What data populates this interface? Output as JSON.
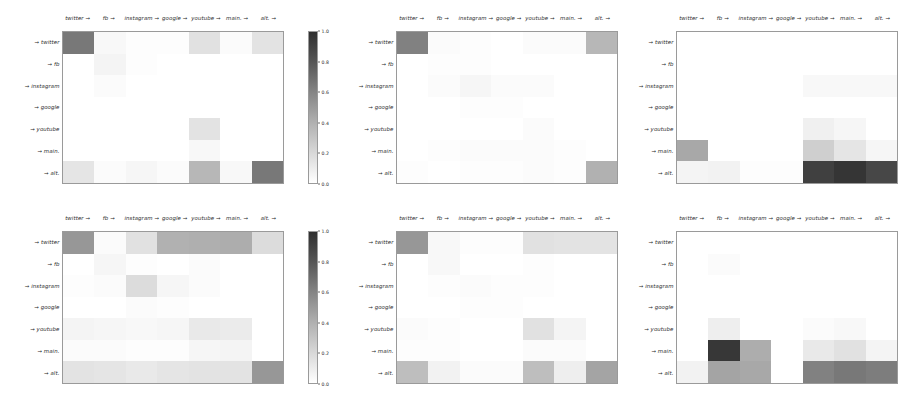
{
  "figure": {
    "width": 911,
    "height": 400,
    "background": "#ffffff",
    "cmap_low": "#ffffff",
    "cmap_high": "#2f2f2f",
    "axis_color": "#9a9a9a"
  },
  "labels": {
    "columns": [
      "twitter →",
      "fb →",
      "instagram →",
      "google →",
      "youtube →",
      "main. →",
      "alt. →"
    ],
    "rows": [
      "→ twitter",
      "→ fb",
      "→ instagram",
      "→ google",
      "→ youtube",
      "→ main.",
      "→ alt."
    ]
  },
  "colorbars": [
    {
      "id": "colorbar-row-1",
      "ticks": [
        "1.0",
        "0.8",
        "0.6",
        "0.4",
        "0.2",
        "0.0"
      ],
      "vmin": 0.0,
      "vmax": 1.0
    },
    {
      "id": "colorbar-row-2",
      "ticks": [
        "1.0",
        "0.8",
        "0.6",
        "0.4",
        "0.2",
        "0.0"
      ],
      "vmin": 0.0,
      "vmax": 1.0
    }
  ],
  "chart_data": {
    "type": "heatmap",
    "title": "",
    "xlabel": "",
    "ylabel": "",
    "grid": false,
    "legend": "colorbar right of first panel in each row",
    "colormap": "Greys",
    "vmin": 0.0,
    "vmax": 1.0,
    "x_tick_labels": [
      "twitter →",
      "fb →",
      "instagram →",
      "google →",
      "youtube →",
      "main. →",
      "alt. →"
    ],
    "y_tick_labels": [
      "→ twitter",
      "→ fb",
      "→ instagram",
      "→ google",
      "→ youtube",
      "→ main.",
      "→ alt."
    ],
    "panels": [
      {
        "id": "panel-top-left",
        "row": 0,
        "col": 0,
        "matrix": [
          [
            0.62,
            0.03,
            0.01,
            0.01,
            0.14,
            0.02,
            0.13
          ],
          [
            0.0,
            0.05,
            0.01,
            0.0,
            0.0,
            0.0,
            0.0
          ],
          [
            0.0,
            0.02,
            0.0,
            0.0,
            0.0,
            0.0,
            0.0
          ],
          [
            0.0,
            0.0,
            0.0,
            0.0,
            0.0,
            0.0,
            0.0
          ],
          [
            0.0,
            0.0,
            0.0,
            0.0,
            0.13,
            0.0,
            0.0
          ],
          [
            0.0,
            0.0,
            0.0,
            0.0,
            0.03,
            0.0,
            0.0
          ],
          [
            0.12,
            0.02,
            0.04,
            0.02,
            0.33,
            0.03,
            0.62
          ]
        ]
      },
      {
        "id": "panel-top-middle",
        "row": 0,
        "col": 1,
        "matrix": [
          [
            0.58,
            0.02,
            0.01,
            0.0,
            0.02,
            0.02,
            0.33
          ],
          [
            0.0,
            0.01,
            0.01,
            0.0,
            0.0,
            0.0,
            0.0
          ],
          [
            0.0,
            0.02,
            0.04,
            0.02,
            0.02,
            0.0,
            0.0
          ],
          [
            0.0,
            0.0,
            0.01,
            0.01,
            0.0,
            0.0,
            0.0
          ],
          [
            0.0,
            0.0,
            0.0,
            0.0,
            0.02,
            0.0,
            0.0
          ],
          [
            0.0,
            0.01,
            0.02,
            0.02,
            0.02,
            0.01,
            0.0
          ],
          [
            0.01,
            0.0,
            0.01,
            0.01,
            0.02,
            0.01,
            0.36
          ]
        ]
      },
      {
        "id": "panel-top-right",
        "row": 0,
        "col": 2,
        "matrix": [
          [
            0.0,
            0.0,
            0.0,
            0.0,
            0.0,
            0.0,
            0.0
          ],
          [
            0.0,
            0.0,
            0.0,
            0.0,
            0.0,
            0.0,
            0.0
          ],
          [
            0.0,
            0.0,
            0.0,
            0.0,
            0.03,
            0.03,
            0.03
          ],
          [
            0.0,
            0.0,
            0.0,
            0.0,
            0.0,
            0.0,
            0.0
          ],
          [
            0.0,
            0.0,
            0.0,
            0.0,
            0.07,
            0.04,
            0.0
          ],
          [
            0.4,
            0.0,
            0.0,
            0.0,
            0.22,
            0.12,
            0.04
          ],
          [
            0.05,
            0.06,
            0.01,
            0.01,
            0.88,
            0.93,
            0.85
          ]
        ]
      },
      {
        "id": "panel-bottom-left",
        "row": 1,
        "col": 0,
        "matrix": [
          [
            0.48,
            0.02,
            0.14,
            0.36,
            0.37,
            0.38,
            0.16
          ],
          [
            0.0,
            0.04,
            0.01,
            0.0,
            0.02,
            0.0,
            0.0
          ],
          [
            0.01,
            0.02,
            0.16,
            0.04,
            0.02,
            0.0,
            0.0
          ],
          [
            0.0,
            0.0,
            0.02,
            0.01,
            0.0,
            0.0,
            0.0
          ],
          [
            0.05,
            0.04,
            0.03,
            0.04,
            0.1,
            0.09,
            0.0
          ],
          [
            0.02,
            0.02,
            0.01,
            0.01,
            0.04,
            0.05,
            0.0
          ],
          [
            0.13,
            0.12,
            0.1,
            0.12,
            0.13,
            0.13,
            0.48
          ]
        ]
      },
      {
        "id": "panel-bottom-middle",
        "row": 1,
        "col": 1,
        "matrix": [
          [
            0.48,
            0.03,
            0.01,
            0.01,
            0.14,
            0.13,
            0.13
          ],
          [
            0.0,
            0.03,
            0.0,
            0.0,
            0.01,
            0.0,
            0.0
          ],
          [
            0.0,
            0.01,
            0.02,
            0.01,
            0.01,
            0.0,
            0.0
          ],
          [
            0.0,
            0.0,
            0.01,
            0.01,
            0.0,
            0.0,
            0.0
          ],
          [
            0.02,
            0.01,
            0.0,
            0.0,
            0.14,
            0.05,
            0.0
          ],
          [
            0.01,
            0.01,
            0.0,
            0.0,
            0.02,
            0.02,
            0.0
          ],
          [
            0.3,
            0.06,
            0.02,
            0.02,
            0.3,
            0.08,
            0.42
          ]
        ]
      },
      {
        "id": "panel-bottom-right",
        "row": 1,
        "col": 2,
        "matrix": [
          [
            0.0,
            0.0,
            0.0,
            0.0,
            0.0,
            0.0,
            0.0
          ],
          [
            0.0,
            0.02,
            0.0,
            0.0,
            0.0,
            0.0,
            0.0
          ],
          [
            0.0,
            0.0,
            0.0,
            0.0,
            0.0,
            0.0,
            0.0
          ],
          [
            0.0,
            0.0,
            0.0,
            0.0,
            0.0,
            0.0,
            0.0
          ],
          [
            0.0,
            0.08,
            0.0,
            0.0,
            0.02,
            0.03,
            0.0
          ],
          [
            0.0,
            0.92,
            0.38,
            0.0,
            0.1,
            0.14,
            0.05
          ],
          [
            0.06,
            0.42,
            0.4,
            0.0,
            0.58,
            0.62,
            0.6
          ]
        ]
      }
    ]
  }
}
